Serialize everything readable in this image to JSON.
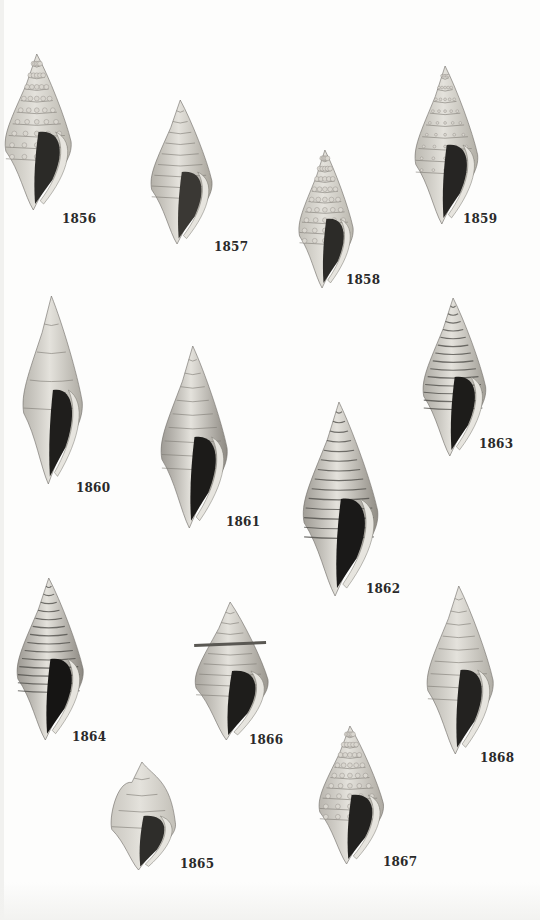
{
  "plate": {
    "background": "#fdfdfc",
    "specimens": [
      {
        "id": "1856",
        "label": "1856",
        "x": 4,
        "y": 52,
        "w": 78,
        "h": 160,
        "lx": 62,
        "ly": 212,
        "tone": "#b9b6ad",
        "dark": "#2b2a27",
        "style": "nodulose"
      },
      {
        "id": "1857",
        "label": "1857",
        "x": 150,
        "y": 98,
        "w": 72,
        "h": 148,
        "lx": 214,
        "ly": 240,
        "tone": "#a9a59c",
        "dark": "#3a3834",
        "style": "ribbed"
      },
      {
        "id": "1858",
        "label": "1858",
        "x": 298,
        "y": 148,
        "w": 64,
        "h": 142,
        "lx": 346,
        "ly": 273,
        "tone": "#bab7ae",
        "dark": "#2c2b28",
        "style": "nodulose"
      },
      {
        "id": "1859",
        "label": "1859",
        "x": 414,
        "y": 64,
        "w": 74,
        "h": 162,
        "lx": 463,
        "ly": 212,
        "tone": "#b2afa6",
        "dark": "#262523",
        "style": "beaded"
      },
      {
        "id": "1860",
        "label": "1860",
        "x": 22,
        "y": 294,
        "w": 70,
        "h": 192,
        "lx": 76,
        "ly": 481,
        "tone": "#aeaba3",
        "dark": "#1f1e1c",
        "style": "smooth"
      },
      {
        "id": "1861",
        "label": "1861",
        "x": 160,
        "y": 344,
        "w": 78,
        "h": 186,
        "lx": 226,
        "ly": 515,
        "tone": "#8e8a83",
        "dark": "#1c1b19",
        "style": "ribbed"
      },
      {
        "id": "1862",
        "label": "1862",
        "x": 302,
        "y": 400,
        "w": 88,
        "h": 198,
        "lx": 366,
        "ly": 582,
        "tone": "#918d85",
        "dark": "#1a1918",
        "style": "striped"
      },
      {
        "id": "1863",
        "label": "1863",
        "x": 422,
        "y": 296,
        "w": 74,
        "h": 162,
        "lx": 479,
        "ly": 437,
        "tone": "#a19e96",
        "dark": "#1d1c1a",
        "style": "striped"
      },
      {
        "id": "1864",
        "label": "1864",
        "x": 16,
        "y": 576,
        "w": 78,
        "h": 166,
        "lx": 72,
        "ly": 730,
        "tone": "#8c8881",
        "dark": "#161514",
        "style": "striped"
      },
      {
        "id": "1865",
        "label": "1865",
        "x": 110,
        "y": 760,
        "w": 76,
        "h": 112,
        "lx": 180,
        "ly": 857,
        "tone": "#c3c0b8",
        "dark": "#2e2d2a",
        "style": "smooth"
      },
      {
        "id": "1866",
        "label": "1866",
        "x": 194,
        "y": 600,
        "w": 86,
        "h": 142,
        "lx": 249,
        "ly": 733,
        "tone": "#9b978f",
        "dark": "#1e1d1b",
        "style": "crowned"
      },
      {
        "id": "1867",
        "label": "1867",
        "x": 318,
        "y": 724,
        "w": 76,
        "h": 142,
        "lx": 383,
        "ly": 855,
        "tone": "#aeaaa2",
        "dark": "#22211f",
        "style": "nodulose"
      },
      {
        "id": "1868",
        "label": "1868",
        "x": 426,
        "y": 584,
        "w": 78,
        "h": 172,
        "lx": 480,
        "ly": 751,
        "tone": "#b1aea6",
        "dark": "#232220",
        "style": "ribbed"
      }
    ]
  }
}
